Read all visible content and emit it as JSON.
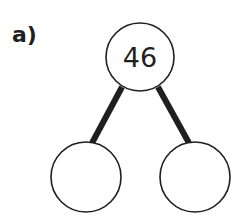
{
  "question_label": "a)",
  "part_whole_model": {
    "whole": "46",
    "parts": [
      "",
      ""
    ]
  },
  "colors": {
    "stroke": "#1f1f1f",
    "background": "#ffffff"
  }
}
